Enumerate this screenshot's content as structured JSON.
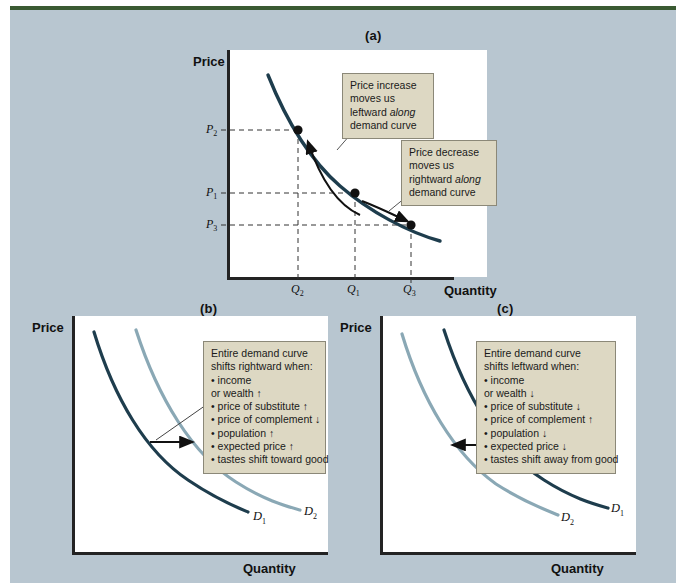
{
  "figure": {
    "background_color": "#b8c6d0",
    "accent_bar_color": "#3a5a32",
    "callout_bg": "#ddd8c3",
    "callout_border": "#8b8878",
    "curve_dark_color": "#1e3d4d",
    "curve_light_color": "#8aa8b5"
  },
  "panel_a": {
    "label": "(a)",
    "y_axis_title": "Price",
    "x_axis_title": "Quantity",
    "y_ticks": [
      {
        "text": "P",
        "sub": "2"
      },
      {
        "text": "P",
        "sub": "1"
      },
      {
        "text": "P",
        "sub": "3"
      }
    ],
    "x_ticks": [
      {
        "text": "Q",
        "sub": "2"
      },
      {
        "text": "Q",
        "sub": "1"
      },
      {
        "text": "Q",
        "sub": "3"
      }
    ],
    "callout_increase": {
      "line1": "Price increase",
      "line2": "moves us",
      "line3_pre": "leftward ",
      "line3_em": "along",
      "line4": "demand curve"
    },
    "callout_decrease": {
      "line1": "Price decrease",
      "line2": "moves us",
      "line3_pre": "rightward ",
      "line3_em": "along",
      "line4": "demand curve"
    }
  },
  "panel_b": {
    "label": "(b)",
    "y_axis_title": "Price",
    "x_axis_title": "Quantity",
    "callout": {
      "heading1": "Entire demand curve",
      "heading2": "shifts rightward when:",
      "items": [
        "• income",
        "   or wealth ↑",
        "• price of substitute ↑",
        "• price of complement ↓",
        "• population ↑",
        "• expected price ↑",
        "• tastes shift toward good"
      ]
    },
    "curve_labels": [
      {
        "text": "D",
        "sub": "2"
      },
      {
        "text": "D",
        "sub": "1"
      }
    ]
  },
  "panel_c": {
    "label": "(c)",
    "y_axis_title": "Price",
    "x_axis_title": "Quantity",
    "callout": {
      "heading1": "Entire demand curve",
      "heading2": "shifts leftward when:",
      "items": [
        "• income",
        "   or wealth ↓",
        "• price of substitute ↓",
        "• price of complement ↑",
        "• population ↓",
        "• expected price ↓",
        "• tastes shift away from good"
      ]
    },
    "curve_labels": [
      {
        "text": "D",
        "sub": "1"
      },
      {
        "text": "D",
        "sub": "2"
      }
    ]
  }
}
